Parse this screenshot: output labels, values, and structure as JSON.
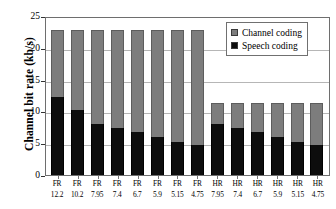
{
  "chart_data": {
    "type": "bar",
    "subtype": "stacked-vertical",
    "title": "",
    "xlabel": "",
    "ylabel": "Channel bit rate (kb/s)",
    "ylim": [
      0,
      25
    ],
    "yticks": [
      0,
      5,
      10,
      15,
      20,
      25
    ],
    "ytick_labels": [
      "0",
      "5",
      "10",
      "15",
      "20",
      "25"
    ],
    "grid": "horizontal",
    "legend_position": "top-right",
    "categories": [
      "FR 12.2",
      "FR 10.2",
      "FR 7.95",
      "FR 7.4",
      "FR 6.7",
      "FR 5.9",
      "FR 5.15",
      "FR 4.75",
      "HR 7.95",
      "HR 7.4",
      "HR 6.7",
      "HR 5.9",
      "HR 5.15",
      "HR 4.75"
    ],
    "category_lines": [
      {
        "line1": "FR",
        "line2": "12.2"
      },
      {
        "line1": "FR",
        "line2": "10.2"
      },
      {
        "line1": "FR",
        "line2": "7.95"
      },
      {
        "line1": "FR",
        "line2": "7.4"
      },
      {
        "line1": "FR",
        "line2": "6.7"
      },
      {
        "line1": "FR",
        "line2": "5.9"
      },
      {
        "line1": "FR",
        "line2": "5.15"
      },
      {
        "line1": "FR",
        "line2": "4.75"
      },
      {
        "line1": "HR",
        "line2": "7.95"
      },
      {
        "line1": "HR",
        "line2": "7.4"
      },
      {
        "line1": "HR",
        "line2": "6.7"
      },
      {
        "line1": "HR",
        "line2": "5.9"
      },
      {
        "line1": "HR",
        "line2": "5.15"
      },
      {
        "line1": "HR",
        "line2": "4.75"
      }
    ],
    "series": [
      {
        "name": "Speech coding",
        "color": "#0d0d0d",
        "values": [
          12.2,
          10.2,
          7.95,
          7.4,
          6.7,
          5.9,
          5.15,
          4.75,
          7.95,
          7.4,
          6.7,
          5.9,
          5.15,
          4.75
        ]
      },
      {
        "name": "Channel coding",
        "color": "#7d7d7d",
        "values": [
          10.6,
          12.6,
          14.85,
          15.4,
          16.1,
          16.9,
          17.65,
          18.05,
          3.45,
          4.0,
          4.7,
          5.5,
          6.25,
          6.65
        ]
      }
    ],
    "totals": [
      22.8,
      22.8,
      22.8,
      22.8,
      22.8,
      22.8,
      22.8,
      22.8,
      11.4,
      11.4,
      11.4,
      11.4,
      11.4,
      11.4
    ]
  },
  "legend": {
    "entries": [
      {
        "label": "Channel coding",
        "color": "#7d7d7d"
      },
      {
        "label": "Speech coding",
        "color": "#0d0d0d"
      }
    ]
  },
  "colors": {
    "channel_coding": "#7d7d7d",
    "speech_coding": "#0d0d0d",
    "gridline": "#b6b6b6",
    "axis": "#6e6e6e",
    "background": "#ffffff"
  }
}
